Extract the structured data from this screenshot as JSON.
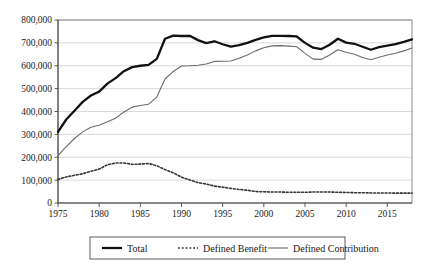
{
  "chart_data": {
    "type": "line",
    "title": "",
    "subtitle": "",
    "xlabel": "",
    "ylabel": "",
    "xlim": [
      1975,
      2018
    ],
    "ylim": [
      0,
      800000
    ],
    "grid": true,
    "legend_position": "bottom",
    "x": [
      1975,
      1976,
      1977,
      1978,
      1979,
      1980,
      1981,
      1982,
      1983,
      1984,
      1985,
      1986,
      1987,
      1988,
      1989,
      1990,
      1991,
      1992,
      1993,
      1994,
      1995,
      1996,
      1997,
      1998,
      1999,
      2000,
      2001,
      2002,
      2003,
      2004,
      2005,
      2006,
      2007,
      2008,
      2009,
      2010,
      2011,
      2012,
      2013,
      2014,
      2015,
      2016,
      2017,
      2018
    ],
    "x_ticks": [
      1975,
      1980,
      1985,
      1990,
      1995,
      2000,
      2005,
      2010,
      2015
    ],
    "x_tick_labels": [
      "1975",
      "1980",
      "1985",
      "1990",
      "1995",
      "2000",
      "2005",
      "2010",
      "2015"
    ],
    "y_ticks": [
      0,
      100000,
      200000,
      300000,
      400000,
      500000,
      600000,
      700000,
      800000
    ],
    "y_tick_labels": [
      "0",
      "100,000",
      "200,000",
      "300,000",
      "400,000",
      "500,000",
      "600,000",
      "700,000",
      "800,000"
    ],
    "series": [
      {
        "name": "Total",
        "style": "solid-thick",
        "color": "#111111",
        "width": 2.3,
        "values": [
          311000,
          365000,
          403000,
          442000,
          470000,
          487000,
          522000,
          546000,
          576000,
          594000,
          600000,
          604000,
          630000,
          718000,
          732000,
          730000,
          731000,
          712000,
          699000,
          707000,
          694000,
          684000,
          690000,
          700000,
          713000,
          724000,
          731000,
          731000,
          730000,
          728000,
          700000,
          679000,
          673000,
          692000,
          718000,
          701000,
          696000,
          683000,
          670000,
          681000,
          688000,
          695000,
          704000,
          715000
        ]
      },
      {
        "name": "Defined Benefit",
        "style": "dotted",
        "color": "#333333",
        "width": 1.6,
        "values": [
          103000,
          114000,
          121000,
          128000,
          139000,
          148000,
          167000,
          175000,
          175000,
          169000,
          170000,
          173000,
          163000,
          146000,
          132000,
          113000,
          101000,
          89000,
          83000,
          74000,
          69000,
          64000,
          59000,
          56000,
          50000,
          49000,
          48000,
          48000,
          47000,
          47000,
          47000,
          48000,
          48000,
          48000,
          47000,
          46000,
          45000,
          45000,
          44000,
          44000,
          44000,
          43000,
          43000,
          43000
        ]
      },
      {
        "name": "Defined Contribution",
        "style": "solid-thin",
        "color": "#6b6b6b",
        "width": 1.1,
        "values": [
          207000,
          246000,
          282000,
          311000,
          331000,
          340000,
          355000,
          371000,
          398000,
          419000,
          426000,
          432000,
          463000,
          542000,
          575000,
          599000,
          600000,
          602000,
          608000,
          619000,
          620000,
          621000,
          633000,
          647000,
          665000,
          679000,
          687000,
          688000,
          686000,
          683000,
          654000,
          629000,
          628000,
          647000,
          670000,
          659000,
          650000,
          636000,
          626000,
          637000,
          647000,
          655000,
          665000,
          678000
        ]
      }
    ]
  },
  "legend": {
    "entries": [
      {
        "label": "Total"
      },
      {
        "label": "Defined Benefit"
      },
      {
        "label": "Defined Contribution"
      }
    ]
  },
  "colors": {
    "total": "#111111",
    "defined_benefit": "#333333",
    "defined_contribution": "#6b6b6b",
    "grid": "#c9c9c9",
    "axis": "#4a4a4a",
    "background": "#ffffff"
  }
}
